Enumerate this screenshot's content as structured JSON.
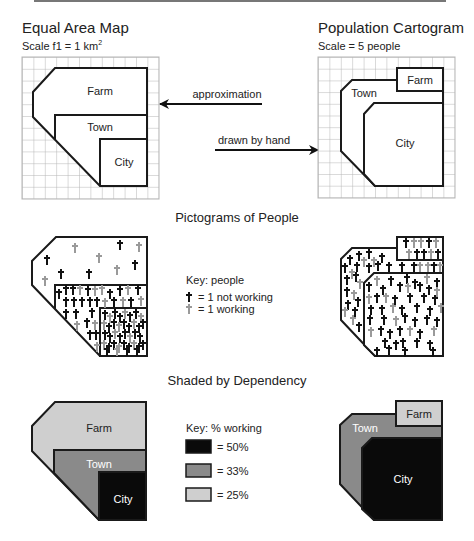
{
  "titles": {
    "equal_area": "Equal Area Map",
    "equal_area_scale": "Scale f1 = 1 km",
    "equal_area_scale_sup": "2",
    "cartogram": "Population Cartogram",
    "cartogram_scale": "Scale = 5 people",
    "pictograms": "Pictograms of People",
    "shaded": "Shaded by Dependency"
  },
  "arrows": {
    "approximation": "approximation",
    "drawn_by_hand": "drawn by hand"
  },
  "regions": {
    "farm": "Farm",
    "town": "Town",
    "city": "City"
  },
  "people_key": {
    "title": "Key: people",
    "not_working": "= 1 not working",
    "working": "= 1 working"
  },
  "shade_key": {
    "title": "Key: % working",
    "items": [
      {
        "label": "= 50%",
        "color": "#0a0a0a"
      },
      {
        "label": "= 33%",
        "color": "#8a8a8a"
      },
      {
        "label": "= 25%",
        "color": "#cfcfcf"
      }
    ]
  },
  "colors": {
    "not_working": "#111111",
    "working": "#9a9a9a",
    "grid": "#b5b5b5",
    "outline": "#1a1a1a"
  }
}
